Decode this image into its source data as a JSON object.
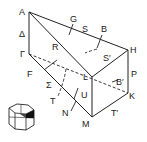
{
  "diagram": {
    "type": "crystal-prism-symmetry",
    "vertices": {
      "A": "A",
      "Gamma": "Γ",
      "L": "L",
      "H": "H",
      "K": "K",
      "M": "M"
    },
    "edge_labels": {
      "Delta": "Δ",
      "R": "R",
      "S": "S",
      "S_prime": "S′",
      "P": "P",
      "T_prime": "T′",
      "U": "U"
    },
    "axis_labels": {
      "G": "G",
      "B": "B",
      "B_prime": "B′",
      "F": "F",
      "Sigma": "Σ",
      "T": "T",
      "N": "N"
    },
    "inset": {
      "name": "hexagonal-brillouin-zone-icon"
    },
    "colors": {
      "line": "#222222",
      "background": "#ffffff",
      "shading": "#111111"
    }
  }
}
